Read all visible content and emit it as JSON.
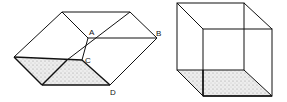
{
  "figure": {
    "left": {
      "title": "Ambiguous parallelepiped with labeled points",
      "labels": {
        "A": "A",
        "B": "B",
        "C": "C",
        "D": "D"
      }
    },
    "right": {
      "title": "Necker cube"
    },
    "colors": {
      "line": "#111111",
      "shade": "#d8d8d8",
      "background": "#ffffff"
    }
  }
}
